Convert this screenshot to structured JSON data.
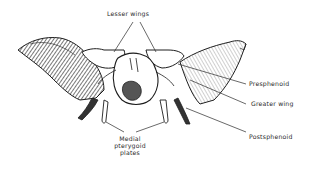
{
  "figure": {
    "colors": {
      "ink": "#1e1e1e",
      "label": "#2a2a2a",
      "background": "#ffffff"
    }
  },
  "labels": {
    "lesser_wings": "Lesser wings",
    "presphenoid": "Presphenoid",
    "greater_wing": "Greater wing",
    "postsphenoid": "Postsphenoid",
    "medial_pterygoid_line1": "Medial",
    "medial_pterygoid_line2": "pterygoid",
    "medial_pterygoid_line3": "plates"
  }
}
